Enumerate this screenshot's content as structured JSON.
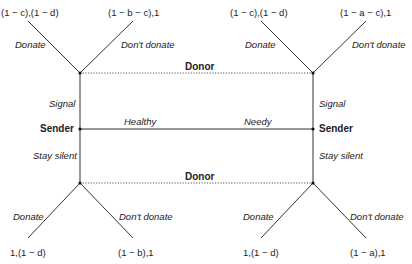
{
  "diagram": {
    "type": "signaling-game-tree",
    "players": {
      "sender": "Sender",
      "donor": "Donor"
    },
    "nature_moves": {
      "left": "Healthy",
      "right": "Needy"
    },
    "sender_actions": {
      "up": "Signal",
      "down": "Stay silent"
    },
    "donor_actions": {
      "donate": "Donate",
      "dont_donate": "Don't donate"
    },
    "information_sets": {
      "top": "Donor",
      "bottom": "Donor"
    },
    "payoffs": {
      "healthy_signal_donate": "(1 − c),(1 − d)",
      "healthy_signal_dont": "(1 − b − c),1",
      "needy_signal_donate": "(1 − c),(1 − d)",
      "needy_signal_dont": "(1 − a − c),1",
      "healthy_silent_donate": "1,(1 − d)",
      "healthy_silent_dont": "(1 − b),1",
      "needy_silent_donate": "1,(1 − d)",
      "needy_silent_dont": "(1 − a),1"
    },
    "colors": {
      "line": "#333333",
      "dotted": "#555555",
      "text": "#222222"
    }
  }
}
